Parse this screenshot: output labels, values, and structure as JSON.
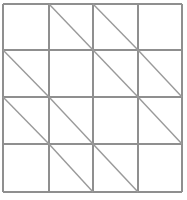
{
  "figure": {
    "name": "diagonal-tiling-grid",
    "kind": "line-drawing",
    "background_color": "#ffffff",
    "canvas": {
      "width": 187,
      "height": 200
    }
  },
  "grid": {
    "rows": 4,
    "columns": 4,
    "x_lines": [
      3,
      49,
      93,
      138,
      182
    ],
    "y_lines": [
      4,
      50,
      97,
      144,
      192
    ],
    "border_color": "#8f8f8f",
    "border_width": 2,
    "gridline_color": "#8f8f8f",
    "gridline_width": 2
  },
  "diagonals": {
    "direction": "top-left-to-bottom-right",
    "color": "#9a9a9a",
    "width": 1.4,
    "cells": [
      {
        "row": 1,
        "col": 1,
        "present": false
      },
      {
        "row": 1,
        "col": 2,
        "present": true
      },
      {
        "row": 1,
        "col": 3,
        "present": true
      },
      {
        "row": 1,
        "col": 4,
        "present": false
      },
      {
        "row": 2,
        "col": 1,
        "present": true
      },
      {
        "row": 2,
        "col": 2,
        "present": false
      },
      {
        "row": 2,
        "col": 3,
        "present": true
      },
      {
        "row": 2,
        "col": 4,
        "present": true
      },
      {
        "row": 3,
        "col": 1,
        "present": true
      },
      {
        "row": 3,
        "col": 2,
        "present": true
      },
      {
        "row": 3,
        "col": 3,
        "present": false
      },
      {
        "row": 3,
        "col": 4,
        "present": true
      },
      {
        "row": 4,
        "col": 1,
        "present": false
      },
      {
        "row": 4,
        "col": 2,
        "present": true
      },
      {
        "row": 4,
        "col": 3,
        "present": true
      },
      {
        "row": 4,
        "col": 4,
        "present": false
      }
    ],
    "matrix": [
      [
        0,
        1,
        1,
        0
      ],
      [
        1,
        0,
        1,
        1
      ],
      [
        1,
        1,
        0,
        1
      ],
      [
        0,
        1,
        1,
        0
      ]
    ]
  }
}
